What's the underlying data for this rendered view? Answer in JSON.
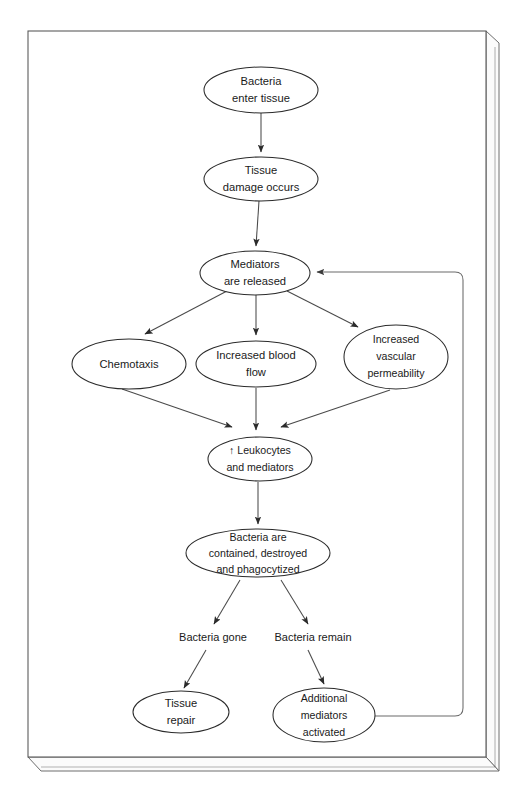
{
  "diagram": {
    "background_color": "#ffffff",
    "node_stroke_color": "#2b2b2b",
    "edge_color": "#4a4a4a",
    "text_color": "#1a1a1a",
    "nodes": [
      {
        "id": "bacteria-enter",
        "lines": [
          "Bacteria",
          "enter tissue"
        ],
        "cx": 261,
        "cy": 90,
        "rx": 57,
        "ry": 23
      },
      {
        "id": "tissue-damage",
        "lines": [
          "Tissue",
          "damage occurs"
        ],
        "cx": 261,
        "cy": 179,
        "rx": 57,
        "ry": 22
      },
      {
        "id": "mediators-released",
        "lines": [
          "Mediators",
          "are released"
        ],
        "cx": 255,
        "cy": 273,
        "rx": 55,
        "ry": 22
      },
      {
        "id": "chemotaxis",
        "lines": [
          "Chemotaxis"
        ],
        "cx": 129,
        "cy": 364,
        "rx": 57,
        "ry": 25
      },
      {
        "id": "increased-blood-flow",
        "lines": [
          "Increased blood",
          "flow"
        ],
        "cx": 256,
        "cy": 364,
        "rx": 60,
        "ry": 23
      },
      {
        "id": "increased-vascular-permeability",
        "lines": [
          "Increased",
          "vascular",
          "permeability"
        ],
        "cx": 396,
        "cy": 357,
        "rx": 52,
        "ry": 32
      },
      {
        "id": "leukocytes-mediators",
        "lines": [
          "↑ Leukocytes",
          "and mediators"
        ],
        "cx": 260,
        "cy": 459,
        "rx": 52,
        "ry": 22
      },
      {
        "id": "bacteria-contained",
        "lines": [
          "Bacteria are",
          "contained, destroyed",
          "and phagocytized"
        ],
        "cx": 258,
        "cy": 553,
        "rx": 72,
        "ry": 24
      },
      {
        "id": "tissue-repair",
        "lines": [
          "Tissue",
          "repair"
        ],
        "cx": 181,
        "cy": 712,
        "rx": 48,
        "ry": 21
      },
      {
        "id": "additional-mediators",
        "lines": [
          "Additional",
          "mediators",
          "activated"
        ],
        "cx": 324,
        "cy": 715,
        "rx": 51,
        "ry": 27
      }
    ],
    "edge_labels": [
      {
        "id": "bacteria-gone",
        "text": "Bacteria gone",
        "x": 213,
        "y": 638
      },
      {
        "id": "bacteria-remain",
        "text": "Bacteria remain",
        "x": 313,
        "y": 638
      }
    ],
    "edges": [
      {
        "from": "bacteria-enter",
        "to": "tissue-damage"
      },
      {
        "from": "tissue-damage",
        "to": "mediators-released"
      },
      {
        "from": "mediators-released",
        "to": "chemotaxis"
      },
      {
        "from": "mediators-released",
        "to": "increased-blood-flow"
      },
      {
        "from": "mediators-released",
        "to": "increased-vascular-permeability"
      },
      {
        "from": "chemotaxis",
        "to": "leukocytes-mediators"
      },
      {
        "from": "increased-blood-flow",
        "to": "leukocytes-mediators"
      },
      {
        "from": "increased-vascular-permeability",
        "to": "leukocytes-mediators"
      },
      {
        "from": "leukocytes-mediators",
        "to": "bacteria-contained"
      },
      {
        "from": "bacteria-contained",
        "to": "bacteria-gone"
      },
      {
        "from": "bacteria-contained",
        "to": "bacteria-remain"
      },
      {
        "from": "bacteria-gone",
        "to": "tissue-repair"
      },
      {
        "from": "bacteria-remain",
        "to": "additional-mediators"
      },
      {
        "from": "additional-mediators",
        "to": "mediators-released",
        "style": "feedback-loop"
      }
    ]
  }
}
